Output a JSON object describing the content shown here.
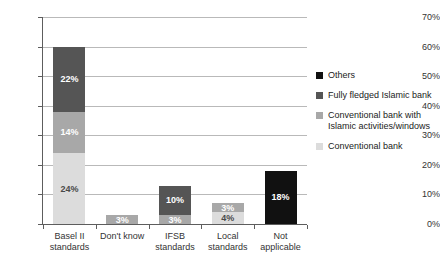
{
  "chart_data": {
    "type": "bar",
    "subtype": "stacked-bar",
    "title": "",
    "xlabel": "",
    "ylabel": "",
    "ylim": [
      0,
      70
    ],
    "ytick_labels": [
      "0%",
      "10%",
      "20%",
      "30%",
      "40%",
      "50%",
      "60%",
      "70%"
    ],
    "ytick_values": [
      0,
      10,
      20,
      30,
      40,
      50,
      60,
      70
    ],
    "grid": true,
    "legend_position": "right",
    "categories": [
      "Basel II standards",
      "Don't know",
      "IFSB standards",
      "Local standards",
      "Not applicable"
    ],
    "category_lines": [
      [
        "Basel II",
        "standards"
      ],
      [
        "Don't know",
        ""
      ],
      [
        "IFSB",
        "standards"
      ],
      [
        "Local",
        "standards"
      ],
      [
        "Not",
        "applicable"
      ]
    ],
    "series": [
      {
        "name": "Conventional bank",
        "color": "#dcdcdc",
        "values": [
          24,
          0,
          0,
          4,
          0
        ],
        "labels": [
          "24%",
          "",
          "",
          "4%",
          ""
        ]
      },
      {
        "name": "Conventional bank with Islamic activities/windows",
        "color": "#a8a8a8",
        "values": [
          14,
          3,
          3,
          3,
          0
        ],
        "labels": [
          "14%",
          "3%",
          "3%",
          "3%",
          ""
        ]
      },
      {
        "name": "Fully fledged Islamic bank",
        "color": "#555555",
        "values": [
          22,
          0,
          10,
          0,
          0
        ],
        "labels": [
          "22%",
          "",
          "10%",
          "",
          ""
        ]
      },
      {
        "name": "Others",
        "color": "#111111",
        "values": [
          0,
          0,
          0,
          0,
          18
        ],
        "labels": [
          "",
          "",
          "",
          "",
          "18%"
        ]
      }
    ],
    "totals": [
      60,
      3,
      13,
      7,
      18
    ]
  },
  "legend": {
    "items": [
      {
        "label": "Others",
        "color": "#111111"
      },
      {
        "label": "Fully fledged Islamic bank",
        "color": "#555555"
      },
      {
        "label": "Conventional bank with Islamic activities/windows",
        "color": "#a8a8a8"
      },
      {
        "label": "Conventional bank",
        "color": "#dcdcdc"
      }
    ]
  },
  "colors": {
    "axis": "#5d5d5d",
    "grid": "#b9b9b9",
    "background": "#ffffff",
    "text": "#333333"
  }
}
